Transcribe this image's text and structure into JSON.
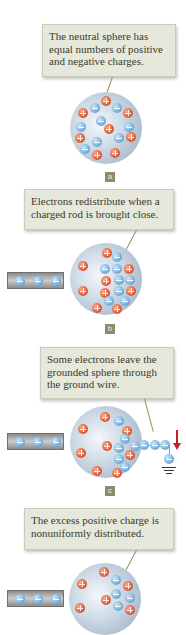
{
  "panels": [
    {
      "id": "a",
      "label": "a",
      "caption": "The neutral sphere has equal numbers of positive and negative charges.",
      "has_rod": false,
      "grounded": false
    },
    {
      "id": "b",
      "label": "b",
      "caption": "Electrons redistribute when a charged rod is brought close.",
      "has_rod": true,
      "grounded": false
    },
    {
      "id": "c",
      "label": "c",
      "caption": "Some electrons leave the grounded sphere through the ground wire.",
      "has_rod": true,
      "grounded": true
    },
    {
      "id": "d",
      "label": "d",
      "caption": "The excess positive charge is nonuniformly distributed.",
      "has_rod": true,
      "grounded": false
    }
  ],
  "colors": {
    "positive": "#d9542f",
    "negative": "#6aa7d7",
    "callout_bg": "#e7e8dc",
    "arrow": "#c42127",
    "label_bg": "#8e8a6a"
  }
}
